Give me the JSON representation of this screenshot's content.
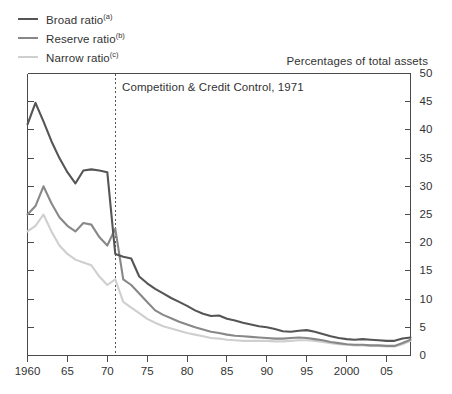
{
  "legend": {
    "position": "top-left",
    "items": [
      {
        "label": "Broad ratio",
        "footnote": "(a)",
        "color": "#555555"
      },
      {
        "label": "Reserve ratio",
        "footnote": "(b)",
        "color": "#888888"
      },
      {
        "label": "Narrow ratio",
        "footnote": "(c)",
        "color": "#cfcfcf"
      }
    ]
  },
  "chart_data": {
    "type": "line",
    "title": "Percentages of total assets",
    "subtitle": "",
    "xlabel": "",
    "ylabel": "",
    "xlim": [
      1960,
      2008
    ],
    "ylim": [
      0,
      50
    ],
    "y_axis_side": "right",
    "y_ticks": [
      0,
      5,
      10,
      15,
      20,
      25,
      30,
      35,
      40,
      45,
      50
    ],
    "y_tick_labels": [
      "0",
      "5",
      "10",
      "15",
      "20",
      "25",
      "30",
      "35",
      "40",
      "45",
      "50"
    ],
    "x_ticks": [
      1960,
      1965,
      1970,
      1975,
      1980,
      1985,
      1990,
      1995,
      2000,
      2005
    ],
    "x_tick_labels": [
      "1960",
      "65",
      "70",
      "75",
      "80",
      "85",
      "90",
      "95",
      "2000",
      "05"
    ],
    "grid": false,
    "legend_position": "top-left",
    "annotations": [
      {
        "text": "Competition & Credit Control, 1971",
        "x": 1971,
        "type": "vertical-dashed-line-with-label"
      }
    ],
    "x": [
      1960,
      1961,
      1962,
      1963,
      1964,
      1965,
      1966,
      1967,
      1968,
      1969,
      1970,
      1971,
      1972,
      1973,
      1974,
      1975,
      1976,
      1977,
      1978,
      1979,
      1980,
      1981,
      1982,
      1983,
      1984,
      1985,
      1986,
      1987,
      1988,
      1989,
      1990,
      1991,
      1992,
      1993,
      1994,
      1995,
      1996,
      1997,
      1998,
      1999,
      2000,
      2001,
      2002,
      2003,
      2004,
      2005,
      2006,
      2007,
      2008
    ],
    "series": [
      {
        "name": "Broad ratio",
        "footnote": "(a)",
        "color": "#555555",
        "values": [
          41.0,
          44.8,
          41.5,
          38.0,
          35.0,
          32.5,
          30.5,
          32.8,
          33.0,
          32.8,
          32.5,
          18.0,
          17.5,
          17.2,
          14.0,
          12.8,
          11.8,
          11.0,
          10.2,
          9.5,
          8.8,
          8.0,
          7.4,
          7.0,
          7.1,
          6.5,
          6.2,
          5.8,
          5.5,
          5.2,
          5.0,
          4.7,
          4.3,
          4.2,
          4.4,
          4.5,
          4.2,
          3.8,
          3.4,
          3.1,
          2.9,
          2.8,
          2.9,
          2.8,
          2.7,
          2.6,
          2.6,
          3.0,
          3.2
        ]
      },
      {
        "name": "Reserve ratio",
        "footnote": "(b)",
        "color": "#888888",
        "values": [
          25.0,
          26.5,
          30.0,
          27.0,
          24.5,
          23.0,
          22.0,
          23.5,
          23.2,
          21.0,
          19.5,
          22.5,
          13.5,
          12.5,
          11.0,
          9.5,
          8.0,
          7.2,
          6.6,
          6.0,
          5.5,
          5.0,
          4.6,
          4.2,
          4.0,
          3.7,
          3.5,
          3.4,
          3.3,
          3.2,
          3.1,
          3.0,
          3.0,
          3.1,
          3.2,
          3.1,
          2.9,
          2.7,
          2.4,
          2.2,
          2.0,
          1.9,
          1.9,
          1.8,
          1.8,
          1.7,
          1.7,
          2.2,
          2.8
        ]
      },
      {
        "name": "Narrow ratio",
        "footnote": "(c)",
        "color": "#cfcfcf",
        "values": [
          22.0,
          23.0,
          25.0,
          22.0,
          19.5,
          18.0,
          17.0,
          16.5,
          16.0,
          14.0,
          12.5,
          13.5,
          9.5,
          8.5,
          7.5,
          6.5,
          5.8,
          5.2,
          4.8,
          4.4,
          4.0,
          3.7,
          3.4,
          3.1,
          3.0,
          2.8,
          2.7,
          2.6,
          2.6,
          2.6,
          2.6,
          2.5,
          2.5,
          2.6,
          2.7,
          2.7,
          2.6,
          2.4,
          2.2,
          2.0,
          1.9,
          1.8,
          1.8,
          1.7,
          1.7,
          1.6,
          1.6,
          2.0,
          2.6
        ]
      }
    ]
  }
}
